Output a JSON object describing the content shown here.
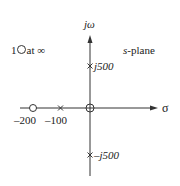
{
  "diagram": {
    "plane_label": "s-plane",
    "plane_label_italic": "s",
    "plane_label_rest": "-plane",
    "vertical_axis_label": "jω",
    "horizontal_axis_label": "σ",
    "zero_at_infinity_note": {
      "count": "1",
      "text": "at ∞"
    },
    "poles": [
      {
        "name": "pole-neg-100",
        "value": "-100"
      },
      {
        "name": "pole-pos-j500",
        "value": "j500",
        "label": "j500"
      },
      {
        "name": "pole-neg-j500",
        "value": "-j500",
        "label": "–j500"
      }
    ],
    "zeros": [
      {
        "name": "zero-neg-200",
        "value": "-200"
      },
      {
        "name": "zero-origin",
        "value": "0"
      }
    ],
    "tick_labels": [
      "–200",
      "–100"
    ],
    "colors": {
      "stroke": "#333333",
      "text": "#222222",
      "background": "#ffffff"
    }
  }
}
